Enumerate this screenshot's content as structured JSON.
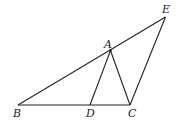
{
  "diagram": {
    "points": {
      "A": {
        "x": 110.5,
        "y": 50.5,
        "label": "A",
        "lx": 104,
        "ly": 48
      },
      "B": {
        "x": 18,
        "y": 105,
        "label": "B",
        "lx": 13,
        "ly": 117
      },
      "C": {
        "x": 130,
        "y": 105,
        "label": "C",
        "lx": 128,
        "ly": 117
      },
      "D": {
        "x": 90,
        "y": 105,
        "label": "D",
        "lx": 86,
        "ly": 117
      },
      "E": {
        "x": 165.5,
        "y": 17,
        "label": "E",
        "lx": 162,
        "ly": 13
      }
    },
    "segments": [
      [
        "B",
        "E"
      ],
      [
        "E",
        "C"
      ],
      [
        "B",
        "C"
      ],
      [
        "A",
        "D"
      ],
      [
        "A",
        "C"
      ]
    ],
    "stroke_color": "#222222"
  }
}
